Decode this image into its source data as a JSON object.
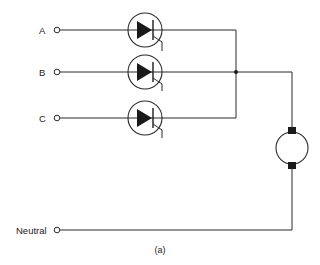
{
  "diagram": {
    "type": "circuit-schematic",
    "inputs": [
      {
        "id": "A",
        "label": "A"
      },
      {
        "id": "B",
        "label": "B"
      },
      {
        "id": "C",
        "label": "C"
      }
    ],
    "neutral": {
      "label": "Neutral"
    },
    "components": [
      {
        "id": "scr-a",
        "kind": "thyristor",
        "phase": "A"
      },
      {
        "id": "scr-b",
        "kind": "thyristor",
        "phase": "B"
      },
      {
        "id": "scr-c",
        "kind": "thyristor",
        "phase": "C"
      },
      {
        "id": "motor",
        "kind": "dc-motor"
      }
    ],
    "caption": "(a)"
  }
}
